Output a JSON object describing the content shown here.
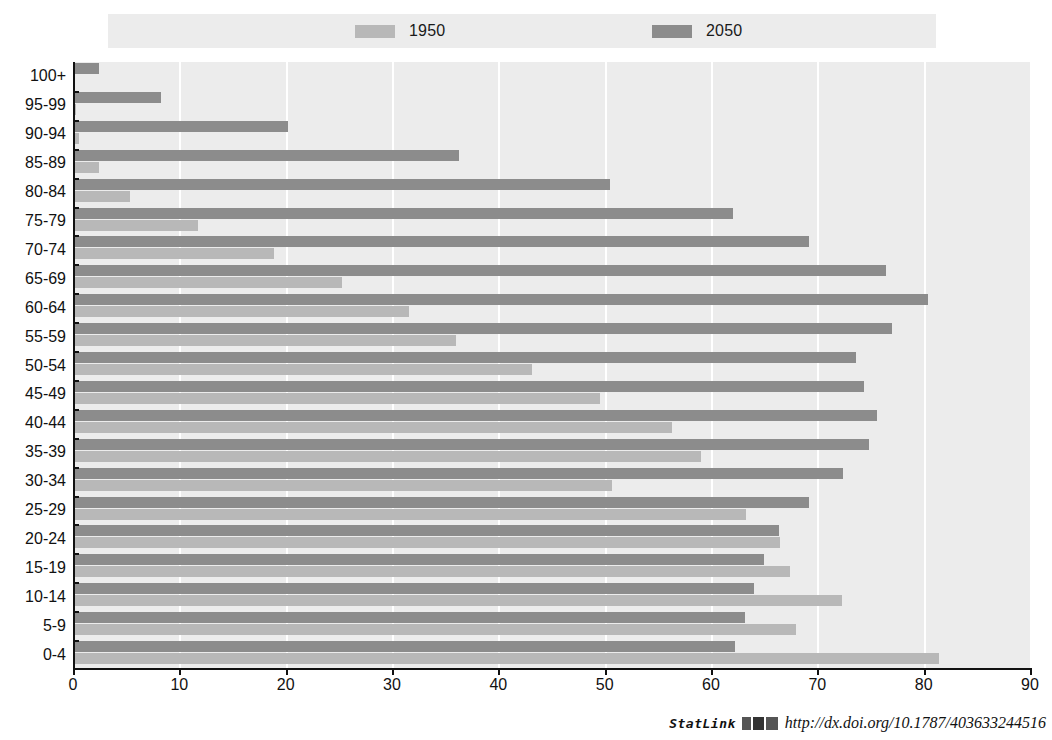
{
  "legend": {
    "items": [
      {
        "label": "1950",
        "color": "#b8b8b8",
        "name": "legend-1950"
      },
      {
        "label": "2050",
        "color": "#8c8c8c",
        "name": "legend-2050"
      }
    ]
  },
  "footer": {
    "statlink_label": "StatLink",
    "statlink_icon": "barcode-icon",
    "url": "http://dx.doi.org/10.1787/403633244516"
  },
  "chart_data": {
    "type": "bar",
    "orientation": "horizontal",
    "title": "",
    "subtitle": "",
    "xlabel": "",
    "ylabel": "",
    "xlim": [
      0,
      90
    ],
    "ylim": null,
    "xticks": [
      0,
      10,
      20,
      30,
      40,
      50,
      60,
      70,
      80,
      90
    ],
    "grid": true,
    "grid_axis": "x",
    "legend_position": "top",
    "categories": [
      "100+",
      "95-99",
      "90-94",
      "85-89",
      "80-84",
      "75-79",
      "70-74",
      "65-69",
      "60-64",
      "55-59",
      "50-54",
      "45-49",
      "40-44",
      "35-39",
      "30-34",
      "25-29",
      "20-24",
      "15-19",
      "10-14",
      "5-9",
      "0-4"
    ],
    "series": [
      {
        "name": "1950",
        "color": "#b8b8b8",
        "values": [
          0.1,
          0.3,
          0.6,
          2.4,
          5.4,
          11.8,
          18.9,
          25.3,
          31.6,
          36.0,
          43.2,
          49.6,
          56.3,
          59.1,
          50.7,
          63.3,
          66.5,
          67.4,
          72.3,
          68.0,
          81.4
        ]
      },
      {
        "name": "2050",
        "color": "#8c8c8c",
        "values": [
          2.4,
          8.3,
          20.2,
          36.3,
          50.5,
          62.1,
          69.2,
          76.5,
          80.4,
          77.0,
          73.6,
          74.4,
          75.6,
          74.9,
          72.4,
          69.2,
          66.4,
          65.0,
          64.0,
          63.2,
          62.3
        ]
      }
    ]
  }
}
